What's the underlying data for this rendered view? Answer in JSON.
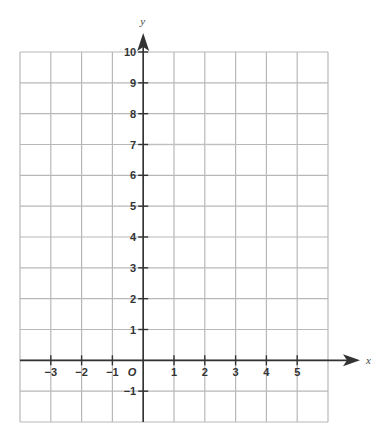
{
  "chart_data": {
    "type": "line",
    "title": "",
    "xlabel": "x",
    "ylabel": "y",
    "origin_label": "O",
    "xlim": [
      -4,
      6
    ],
    "ylim": [
      -2,
      10
    ],
    "grid": true,
    "x_ticks": [
      -3,
      -2,
      -1,
      1,
      2,
      3,
      4,
      5
    ],
    "x_tick_labels": [
      "−3",
      "−2",
      "−1",
      "1",
      "2",
      "3",
      "4",
      "5"
    ],
    "y_ticks": [
      10,
      9,
      8,
      7,
      6,
      5,
      4,
      3,
      2,
      1,
      -1
    ],
    "y_tick_labels": [
      "10",
      "9",
      "8",
      "7",
      "6",
      "5",
      "4",
      "3",
      "2",
      "1",
      "−1"
    ],
    "series": [
      {
        "name": "faint line y=7",
        "x": [
          0,
          3
        ],
        "y": [
          7,
          7
        ],
        "style": "faint dotted"
      }
    ]
  },
  "colors": {
    "grid": "#b8b8b8",
    "axis": "#333333",
    "faint_line": "#c8c8c8"
  }
}
